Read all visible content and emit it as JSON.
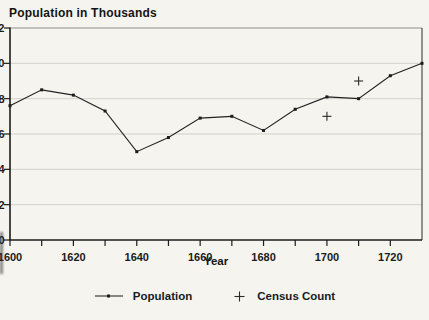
{
  "window": {
    "width": 429,
    "height": 320,
    "background": "#f5f4ef"
  },
  "chart": {
    "title": "Population in Thousands",
    "x_axis_label": "Year",
    "legend_items": [
      {
        "label": "Population",
        "marker": "line-with-dot"
      },
      {
        "label": "Census Count",
        "marker": "plus"
      }
    ],
    "colors": {
      "ink": "#1c1c1c",
      "gridline": "#d2d1ca",
      "frame_top": "#8f8e88",
      "background": "#f5f4ef"
    }
  },
  "chart_data": {
    "type": "line",
    "title": "Population in Thousands",
    "xlabel": "Year",
    "ylabel": "Population in Thousands",
    "xlim": [
      1600,
      1730
    ],
    "ylim": [
      0,
      12
    ],
    "x_major_ticks": [
      1600,
      1620,
      1640,
      1660,
      1680,
      1700,
      1720
    ],
    "x_minor_tick_step": 10,
    "x_minor_tick_last": 1720,
    "y_ticks": [
      0,
      2,
      4,
      6,
      8,
      10,
      12
    ],
    "grid": "horizontal",
    "legend_position": "bottom-center",
    "series": [
      {
        "name": "Population",
        "type": "line",
        "marker": "dot",
        "x": [
          1600,
          1610,
          1620,
          1630,
          1640,
          1650,
          1660,
          1670,
          1680,
          1690,
          1700,
          1710,
          1720,
          1730
        ],
        "y": [
          7.6,
          8.5,
          8.2,
          7.3,
          5.0,
          5.8,
          6.9,
          7.0,
          6.2,
          7.4,
          8.1,
          8.0,
          9.3,
          10.0
        ]
      },
      {
        "name": "Census Count",
        "type": "scatter",
        "marker": "plus",
        "x": [
          1700,
          1710
        ],
        "y": [
          7.0,
          9.0
        ]
      }
    ]
  }
}
